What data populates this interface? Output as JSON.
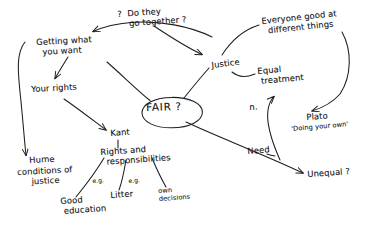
{
  "diagram": {
    "title_text": "FAIR ?",
    "ink_color": "#1b1d21",
    "paper_color": "#ffffff",
    "center": {
      "label": "FAIR ?",
      "shape": "ellipse"
    },
    "nodes": [
      {
        "id": "do-they-go-together",
        "text": "?  Do they\n    go together ?",
        "x": 117,
        "y": 10,
        "rotate": -4,
        "size": "normal"
      },
      {
        "id": "everyone-good-at-different-things",
        "text": "Everyone good at\n  different things",
        "x": 261,
        "y": 17,
        "rotate": -6,
        "size": "normal"
      },
      {
        "id": "getting-what-you-want",
        "text": "Getting what\n  you want",
        "x": 36,
        "y": 38,
        "rotate": -3,
        "size": "normal"
      },
      {
        "id": "justice",
        "text": "Justice",
        "x": 211,
        "y": 61,
        "rotate": -7,
        "size": "normal"
      },
      {
        "id": "equal-treatment",
        "text": "Equal\n treatment",
        "x": 257,
        "y": 67,
        "rotate": -5,
        "size": "normal"
      },
      {
        "id": "your-rights",
        "text": "Your rights",
        "x": 31,
        "y": 85,
        "rotate": -3,
        "size": "normal"
      },
      {
        "id": "n-marker",
        "text": "n.",
        "x": 249,
        "y": 103,
        "rotate": -4,
        "size": "normal"
      },
      {
        "id": "fair-center",
        "text": "FAIR ?",
        "x": 146,
        "y": 101,
        "rotate": -2,
        "size": "center"
      },
      {
        "id": "plato",
        "text": "Plato",
        "x": 306,
        "y": 113,
        "rotate": -4,
        "size": "normal"
      },
      {
        "id": "plato-quote",
        "text": "'Doing your own'",
        "x": 291,
        "y": 126,
        "rotate": -5,
        "size": "small"
      },
      {
        "id": "kant",
        "text": "Kant",
        "x": 110,
        "y": 129,
        "rotate": -4,
        "size": "normal"
      },
      {
        "id": "need",
        "text": "Need",
        "x": 247,
        "y": 147,
        "rotate": -5,
        "size": "normal"
      },
      {
        "id": "rights-and-responsibilities",
        "text": "Rights and\n  responsibilities",
        "x": 100,
        "y": 148,
        "rotate": -4,
        "size": "normal"
      },
      {
        "id": "hume",
        "text": "Hume",
        "x": 29,
        "y": 156,
        "rotate": -3,
        "size": "normal"
      },
      {
        "id": "conditions-of-justice",
        "text": "conditions of\n     justice",
        "x": 17,
        "y": 168,
        "rotate": -3,
        "size": "normal"
      },
      {
        "id": "unequal",
        "text": "Unequal ?",
        "x": 307,
        "y": 170,
        "rotate": -4,
        "size": "normal"
      },
      {
        "id": "eg-left",
        "text": "e.g.",
        "x": 92,
        "y": 177,
        "rotate": -4,
        "size": "tiny"
      },
      {
        "id": "eg-middle",
        "text": "e.g.",
        "x": 128,
        "y": 177,
        "rotate": -4,
        "size": "tiny"
      },
      {
        "id": "litter",
        "text": "Litter",
        "x": 110,
        "y": 191,
        "rotate": -4,
        "size": "normal"
      },
      {
        "id": "own-decisions",
        "text": "own\ndecisions",
        "x": 158,
        "y": 188,
        "rotate": -4,
        "size": "small"
      },
      {
        "id": "good-education",
        "text": "Good\n education",
        "x": 60,
        "y": 197,
        "rotate": -4,
        "size": "normal"
      }
    ],
    "connectors": [
      {
        "id": "link-go-together-to-getting-what-you-want",
        "from": "do-they-go-together",
        "to": "getting-what-you-want",
        "arrow": "to"
      },
      {
        "id": "link-go-together-to-justice",
        "from": "do-they-go-together",
        "to": "justice",
        "arrow": "to"
      },
      {
        "id": "link-getting-what-you-want-to-your-rights",
        "from": "getting-what-you-want",
        "to": "your-rights",
        "arrow": "to"
      },
      {
        "id": "link-getting-what-you-want-to-hume",
        "from": "getting-what-you-want",
        "to": "hume",
        "arrow": "to"
      },
      {
        "id": "link-getting-what-you-want-to-fair",
        "from": "getting-what-you-want",
        "to": "fair-center",
        "arrow": "none"
      },
      {
        "id": "link-fair-to-justice",
        "from": "fair-center",
        "to": "justice",
        "arrow": "none"
      },
      {
        "id": "link-justice-to-equal-treatment",
        "from": "justice",
        "to": "equal-treatment",
        "arrow": "none"
      },
      {
        "id": "link-everyone-good-to-justice",
        "from": "everyone-good-at-different-things",
        "to": "justice",
        "arrow": "none"
      },
      {
        "id": "link-everyone-good-to-plato",
        "from": "everyone-good-at-different-things",
        "to": "plato",
        "arrow": "to"
      },
      {
        "id": "link-n-marker-to-equal-treatment",
        "from": "n-marker",
        "to": "equal-treatment",
        "arrow": "to"
      },
      {
        "id": "link-fair-to-unequal-need",
        "from": "fair-center",
        "to": "unequal",
        "arrow": "to",
        "label": "Need"
      },
      {
        "id": "link-your-rights-to-kant",
        "from": "your-rights",
        "to": "kant",
        "arrow": "to"
      },
      {
        "id": "link-kant-to-rights-and-responsibilities",
        "from": "kant",
        "to": "rights-and-responsibilities",
        "arrow": "none"
      },
      {
        "id": "link-rights-to-good-education",
        "from": "rights-and-responsibilities",
        "to": "good-education",
        "arrow": "none",
        "label": "e.g."
      },
      {
        "id": "link-rights-to-litter",
        "from": "rights-and-responsibilities",
        "to": "litter",
        "arrow": "none",
        "label": "e.g."
      },
      {
        "id": "link-rights-to-own-decisions",
        "from": "rights-and-responsibilities",
        "to": "own-decisions",
        "arrow": "none"
      }
    ]
  }
}
